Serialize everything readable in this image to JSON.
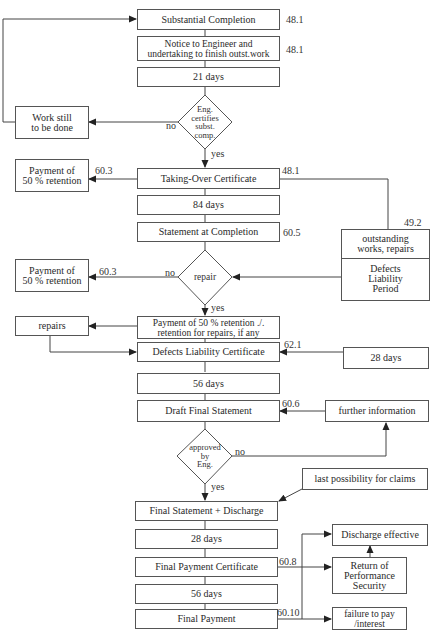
{
  "main_flow": {
    "substantial_completion": {
      "label": "Substantial Completion",
      "ref": "48.1"
    },
    "notice_to_engineer": {
      "label": "Notice to Engineer and\nundertaking to finish outst.work",
      "ref": "48.1"
    },
    "days_21": {
      "label": "21 days"
    },
    "decision_certifies": {
      "label": "Eng.\ncertifies\nsubst.\ncomp.",
      "no": "no",
      "yes": "yes"
    },
    "taking_over_certificate": {
      "label": "Taking-Over Certificate",
      "ref": "48.1"
    },
    "days_84": {
      "label": "84 days"
    },
    "statement_at_completion": {
      "label": "Statement at Completion",
      "ref": "60.5"
    },
    "decision_repair": {
      "label": "repair",
      "no": "no",
      "yes": "yes"
    },
    "payment_retention_repairs": {
      "label": "Payment of 50 % retention ./.\nretention for repairs, if any"
    },
    "defects_liability_certificate": {
      "label": "Defects Liability Certificate",
      "ref": "62.1"
    },
    "days_56_a": {
      "label": "56 days"
    },
    "draft_final_statement": {
      "label": "Draft Final Statement",
      "ref": "60.6"
    },
    "decision_approved": {
      "label": "approved\nby\nEng.",
      "no": "no",
      "yes": "yes"
    },
    "final_statement_discharge": {
      "label": "Final Statement + Discharge"
    },
    "days_28": {
      "label": "28 days"
    },
    "final_payment_certificate": {
      "label": "Final Payment Certificate",
      "ref": "60.8"
    },
    "days_56_b": {
      "label": "56 days"
    },
    "final_payment": {
      "label": "Final Payment",
      "ref": "60.10"
    }
  },
  "left_branch": {
    "work_still_to_be_done": {
      "label": "Work still\nto be done"
    },
    "payment_50_retention_1": {
      "label": "Payment of\n50 % retention",
      "ref": "60.3"
    },
    "payment_50_retention_2": {
      "label": "Payment of\n50 % retention",
      "ref": "60.3"
    },
    "repairs": {
      "label": "repairs"
    }
  },
  "right_branch": {
    "outstanding_works": {
      "top": "outstanding\nworks, repairs",
      "bottom": "Defects\nLiability\nPeriod",
      "ref": "49.2"
    },
    "days_28_side": {
      "label": "28 days"
    },
    "further_information": {
      "label": "further information"
    },
    "last_possibility_claims": {
      "label": "last possibility for claims"
    },
    "discharge_effective": {
      "label": "Discharge effective"
    },
    "return_performance_security": {
      "label": "Return of\nPerformance\nSecurity"
    },
    "failure_to_pay": {
      "label": "failure to pay\n/interest"
    }
  },
  "colors": {
    "line": "#444444",
    "box_border": "#555555",
    "text": "#2a2a2a",
    "background": "#ffffff"
  }
}
